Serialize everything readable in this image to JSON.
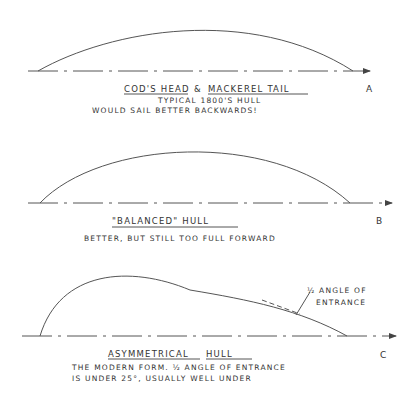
{
  "diagrams": [
    {
      "id": "A",
      "tag": "A",
      "title_part1": "COD'S HEAD",
      "title_joiner": "&",
      "title_part2": "MACKEREL TAIL",
      "line1": "TYPICAL 1800'S HULL",
      "line2": "WOULD SAIL BETTER BACKWARDS!"
    },
    {
      "id": "B",
      "tag": "B",
      "title": "\"BALANCED\" HULL",
      "line1": "BETTER, BUT STILL TOO FULL FORWARD"
    },
    {
      "id": "C",
      "tag": "C",
      "title_part1": "ASYMMETRICAL",
      "title_part2": "HULL",
      "line1": "THE MODERN FORM. ½ ANGLE OF ENTRANCE",
      "line2": "IS UNDER 25°, USUALLY WELL UNDER",
      "callout_line1": "½ ANGLE OF",
      "callout_line2": "ENTRANCE"
    }
  ],
  "colors": {
    "ink": "#333333",
    "line": "#555555",
    "background": "#ffffff"
  }
}
